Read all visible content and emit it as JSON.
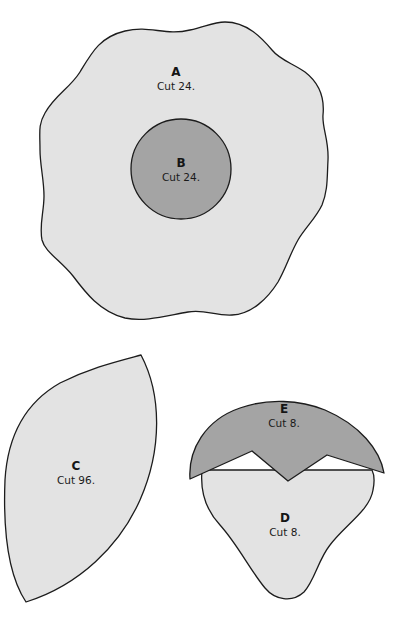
{
  "diagram": {
    "type": "pattern-templates",
    "colors": {
      "light_fill": "#e3e3e3",
      "dark_fill": "#a4a4a4",
      "outline": "#1c1c1c",
      "background": "#ffffff"
    },
    "pieces": [
      {
        "id": "A",
        "letter": "A",
        "cut": "Cut 24.",
        "shape": "wavy-circle",
        "fill": "light"
      },
      {
        "id": "B",
        "letter": "B",
        "cut": "Cut 24.",
        "shape": "circle",
        "fill": "dark"
      },
      {
        "id": "C",
        "letter": "C",
        "cut": "Cut 96.",
        "shape": "leaf",
        "fill": "light"
      },
      {
        "id": "D",
        "letter": "D",
        "cut": "Cut 8.",
        "shape": "bulb",
        "fill": "light"
      },
      {
        "id": "E",
        "letter": "E",
        "cut": "Cut 8.",
        "shape": "zigzag-cap",
        "fill": "dark"
      }
    ]
  }
}
